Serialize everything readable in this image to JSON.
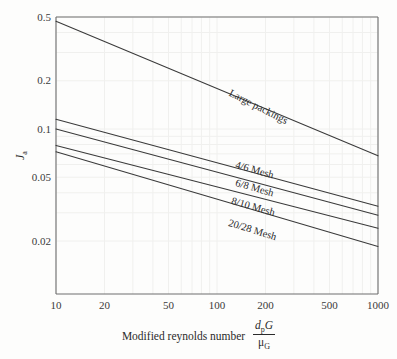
{
  "chart_data": {
    "type": "line",
    "title": "",
    "xlabel": "Modified reynolds number",
    "xlabel_fraction": {
      "numerator": "dpG",
      "denominator": "μG"
    },
    "ylabel": "Ja",
    "xscale": "log",
    "yscale": "log",
    "xlim": [
      10,
      1000
    ],
    "ylim": [
      0.015,
      0.5
    ],
    "grid": true,
    "legend_position": "inline-along-curves",
    "xticks": [
      10,
      20,
      50,
      100,
      200,
      500,
      1000
    ],
    "xtick_labels": [
      "10",
      "20",
      "50",
      "100",
      "200",
      "500",
      "1000"
    ],
    "yticks": [
      0.5,
      0.2,
      0.1,
      0.05,
      0.02
    ],
    "ytick_labels": [
      "0.5",
      "0.2",
      "0.1",
      "0.05",
      "0.02"
    ],
    "series": [
      {
        "name": "Large packings",
        "label_angle_deg": 27,
        "x": [
          10,
          1000
        ],
        "y": [
          0.47,
          0.068
        ]
      },
      {
        "name": "4/6 Mesh",
        "label_angle_deg": 16,
        "x": [
          10,
          1000
        ],
        "y": [
          0.115,
          0.033
        ]
      },
      {
        "name": "6/8 Mesh",
        "label_angle_deg": 16,
        "x": [
          10,
          1000
        ],
        "y": [
          0.1,
          0.029
        ]
      },
      {
        "name": "8/10 Mesh",
        "label_angle_deg": 16,
        "x": [
          10,
          1000
        ],
        "y": [
          0.079,
          0.024
        ]
      },
      {
        "name": "20/28 Mesh",
        "label_angle_deg": 17,
        "x": [
          10,
          1000
        ],
        "y": [
          0.072,
          0.0185
        ]
      }
    ],
    "colors": {
      "line": "#3a3a3a",
      "axis": "#6e6e6e",
      "grid": "#f0f0ee",
      "background": "#fdfdfc",
      "text": "#2b2b2b"
    }
  },
  "axis_geometry": {
    "plot_left": 56,
    "plot_right": 378,
    "plot_top": 17,
    "plot_bottom": 294
  },
  "curve_label_positions": [
    {
      "name": "Large packings",
      "x": 232,
      "y": 88
    },
    {
      "name": "4/6 Mesh",
      "x": 237,
      "y": 160
    },
    {
      "name": "6/8 Mesh",
      "x": 237,
      "y": 178
    },
    {
      "name": "8/10 Mesh",
      "x": 233,
      "y": 196
    },
    {
      "name": "20/28 Mesh",
      "x": 230,
      "y": 218
    }
  ]
}
